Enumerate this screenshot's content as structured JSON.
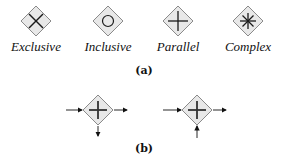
{
  "panel_a": {
    "caption": "(a)",
    "gateways": [
      {
        "label": "Exclusive",
        "marker": "x-cross-icon",
        "cx": 36
      },
      {
        "label": "Inclusive",
        "marker": "circle-icon",
        "cx": 108
      },
      {
        "label": "Parallel",
        "marker": "plus-icon",
        "cx": 178
      },
      {
        "label": "Complex",
        "marker": "asterisk-icon",
        "cx": 248
      }
    ]
  },
  "panel_b": {
    "caption": "(b)",
    "gateways": [
      {
        "name": "parallel-split",
        "marker": "plus-icon",
        "incoming": [
          "left"
        ],
        "outgoing": [
          "right",
          "bottom"
        ]
      },
      {
        "name": "parallel-join",
        "marker": "plus-icon",
        "incoming": [
          "left",
          "bottom"
        ],
        "outgoing": [
          "right"
        ]
      }
    ]
  },
  "colors": {
    "diamond_fill": "#e6e6e6",
    "diamond_stroke": "#8a8a8a",
    "marker": "#1a1a1a"
  }
}
